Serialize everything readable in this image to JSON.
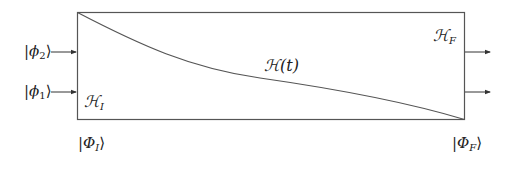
{
  "diagram": {
    "type": "adiabatic-evolution-box",
    "box": {
      "x": 77,
      "y": 12,
      "width": 387,
      "height": 107,
      "stroke": "#555555"
    },
    "curve": {
      "from": [
        77,
        12
      ],
      "to": [
        464,
        119
      ],
      "label": "ℋ(t)"
    },
    "inputs": [
      {
        "label_prefix": "|ϕ",
        "sub": "2",
        "label_suffix": "⟩",
        "y": 52
      },
      {
        "label_prefix": "|ϕ",
        "sub": "1",
        "label_suffix": "⟩",
        "y": 92
      }
    ],
    "outputs": [
      {
        "y": 52
      },
      {
        "y": 92
      }
    ],
    "labels": {
      "H_initial": {
        "main": "ℋ",
        "sub": "I"
      },
      "H_final": {
        "main": "ℋ",
        "sub": "F"
      },
      "H_t": "ℋ(t)",
      "state_initial": {
        "prefix": "|Φ",
        "sub": "I",
        "suffix": "⟩"
      },
      "state_final": {
        "prefix": "|Φ",
        "sub": "F",
        "suffix": "⟩"
      }
    }
  }
}
